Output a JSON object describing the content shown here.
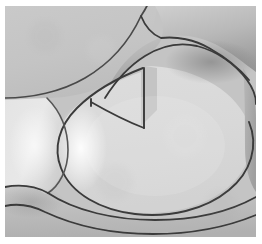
{
  "figure": {
    "kind": "grayscale-micrograph",
    "width": 262,
    "height": 244,
    "background": "#ffffff",
    "margins": {
      "left": 5,
      "top": 6,
      "right": 6,
      "bottom": 7
    },
    "plate": {
      "x": 5,
      "y": 6,
      "width": 251,
      "height": 231
    },
    "caption": "",
    "colors": {
      "page_background": "#ffffff",
      "matrix_light": "#d9d9d9",
      "matrix_mid": "#c4c4c4",
      "matrix_dark": "#a7a7a7",
      "matrix_darker": "#8f8f8f",
      "highlight": "#f2f2f2",
      "grain_boundary": "#3a3a3a",
      "grain_boundary_soft": "#6e6e6e"
    },
    "regions": [
      {
        "name": "upper-left-grain",
        "label": "upper left grain",
        "fill_start": "#c9c9c9",
        "fill_end": "#bdbdbd",
        "tone": "medium gray, nearly flat"
      },
      {
        "name": "upper-right-arm-grain",
        "label": "upper right arm grain",
        "fill_start": "#d2d2d2",
        "fill_end": "#8d8d8d",
        "tone": "band shading from light at top to dark at lower edge"
      },
      {
        "name": "central-oval-grain",
        "label": "central oval grain",
        "fill_start": "#dddddd",
        "fill_end": "#d2d2d2",
        "tone": "large flat light gray interior"
      },
      {
        "name": "left-cell-grain",
        "label": "left cell grain",
        "fill_start": "#e4e4e4",
        "fill_end": "#cfcfcf",
        "tone": "light with bright inner highlight"
      },
      {
        "name": "lower-band-grain",
        "label": "lower band grain",
        "fill_start": "#c8c8c8",
        "fill_end": "#b4b4b4",
        "tone": "thin band below the oval"
      },
      {
        "name": "bottom-strip-grain",
        "label": "bottom strip grain",
        "fill_start": "#bfbfbf",
        "fill_end": "#b0b0b0",
        "tone": "darker strip at the very bottom"
      },
      {
        "name": "right-edge-grain",
        "label": "right edge grain",
        "fill_start": "#b9b9b9",
        "fill_end": "#9f9f9f",
        "tone": "dark wedge at right margin"
      }
    ],
    "boundaries": [
      {
        "name": "upper-left-arc",
        "label": "upper left arc boundary"
      },
      {
        "name": "arm-upper-edge",
        "label": "arm upper edge boundary"
      },
      {
        "name": "arm-lower-edge",
        "label": "arm lower edge boundary"
      },
      {
        "name": "oval-outline",
        "label": "central oval outline"
      },
      {
        "name": "notch-vertical",
        "label": "notch vertical boundary"
      },
      {
        "name": "left-cell-arc",
        "label": "left cell arc boundary"
      },
      {
        "name": "lower-long-arc",
        "label": "lower long arc boundary"
      },
      {
        "name": "bottom-arc",
        "label": "bottom arc boundary"
      }
    ],
    "features": [
      {
        "name": "triple-junction-upper",
        "label": "upper triple junction",
        "x": 86,
        "y": 93
      },
      {
        "name": "triple-junction-left",
        "label": "left triple junction",
        "x": 43,
        "y": 186
      },
      {
        "name": "notch-vertex",
        "label": "notch vertex",
        "x": 140,
        "y": 122
      },
      {
        "name": "left-highlight",
        "label": "bright highlight band",
        "x": 78,
        "y": 140
      }
    ]
  }
}
